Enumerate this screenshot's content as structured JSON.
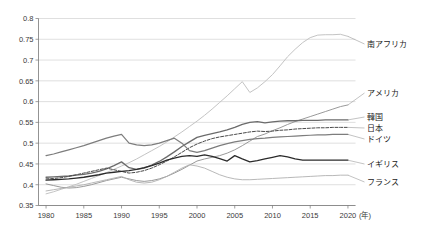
{
  "chart_data": {
    "type": "line",
    "title": "",
    "subtitle": "",
    "xlabel": "(年)",
    "ylabel": "",
    "xlim": [
      1979,
      2021
    ],
    "ylim": [
      0.35,
      0.8
    ],
    "grid": true,
    "legend_position": "right-inline-labels",
    "x_ticks": [
      1980,
      1985,
      1990,
      1995,
      2000,
      2005,
      2010,
      2015,
      2020
    ],
    "x_tick_labels": [
      "1980",
      "1985",
      "1990",
      "1995",
      "2000",
      "2005",
      "2010",
      "2015",
      "2020"
    ],
    "y_ticks": [
      0.35,
      0.4,
      0.45,
      0.5,
      0.55,
      0.6,
      0.65,
      0.7,
      0.75,
      0.8
    ],
    "y_tick_labels": [
      "0.35",
      "0.4",
      "0.45",
      "0.5",
      "0.55",
      "0.6",
      "0.65",
      "0.7",
      "0.75",
      "0.8"
    ],
    "x": [
      1980,
      1981,
      1982,
      1983,
      1984,
      1985,
      1986,
      1987,
      1988,
      1989,
      1990,
      1991,
      1992,
      1993,
      1994,
      1995,
      1996,
      1997,
      1998,
      1999,
      2000,
      2001,
      2002,
      2003,
      2004,
      2005,
      2006,
      2007,
      2008,
      2009,
      2010,
      2011,
      2012,
      2013,
      2014,
      2015,
      2016,
      2017,
      2018,
      2019,
      2020
    ],
    "series": [
      {
        "name": "南アフリカ",
        "label": "南アフリカ",
        "color": "#c4c4c4",
        "style": "solid",
        "width": 1.0,
        "label_value": 0.757,
        "values": [
          0.378,
          0.383,
          0.389,
          0.395,
          0.401,
          0.408,
          0.415,
          0.422,
          0.429,
          0.437,
          0.445,
          0.453,
          0.462,
          0.472,
          0.482,
          0.492,
          0.503,
          0.515,
          0.527,
          0.54,
          0.553,
          0.567,
          0.582,
          0.598,
          0.614,
          0.631,
          0.648,
          0.622,
          0.633,
          0.648,
          0.665,
          0.686,
          0.708,
          0.726,
          0.742,
          0.754,
          0.76,
          0.761,
          0.761,
          0.762,
          0.757
        ]
      },
      {
        "name": "アメリカ",
        "label": "アメリカ",
        "color": "#9a9a9a",
        "style": "solid",
        "width": 1.0,
        "label_value": 0.592,
        "values": [
          0.402,
          0.398,
          0.394,
          0.392,
          0.393,
          0.396,
          0.4,
          0.405,
          0.41,
          0.414,
          0.418,
          0.414,
          0.41,
          0.408,
          0.41,
          0.414,
          0.42,
          0.428,
          0.437,
          0.447,
          0.457,
          0.462,
          0.466,
          0.47,
          0.476,
          0.484,
          0.494,
          0.505,
          0.516,
          0.522,
          0.53,
          0.537,
          0.545,
          0.552,
          0.558,
          0.564,
          0.57,
          0.576,
          0.582,
          0.588,
          0.592
        ]
      },
      {
        "name": "韓国",
        "label": "韓国",
        "color": "#6b6b6b",
        "style": "solid",
        "width": 1.3,
        "label_value": 0.556,
        "values": [
          0.418,
          0.419,
          0.42,
          0.421,
          0.423,
          0.425,
          0.428,
          0.432,
          0.438,
          0.446,
          0.455,
          0.441,
          0.437,
          0.44,
          0.447,
          0.456,
          0.467,
          0.479,
          0.492,
          0.503,
          0.514,
          0.519,
          0.523,
          0.527,
          0.532,
          0.538,
          0.545,
          0.55,
          0.552,
          0.549,
          0.551,
          0.553,
          0.554,
          0.554,
          0.555,
          0.555,
          0.555,
          0.556,
          0.556,
          0.556,
          0.556
        ]
      },
      {
        "name": "日本",
        "label": "日本",
        "color": "#4a4a4a",
        "style": "dashed",
        "width": 1.0,
        "label_value": 0.538,
        "values": [
          0.414,
          0.415,
          0.417,
          0.42,
          0.424,
          0.428,
          0.432,
          0.436,
          0.44,
          0.436,
          0.432,
          0.428,
          0.43,
          0.434,
          0.44,
          0.448,
          0.457,
          0.467,
          0.478,
          0.489,
          0.498,
          0.505,
          0.511,
          0.515,
          0.518,
          0.521,
          0.524,
          0.527,
          0.529,
          0.528,
          0.529,
          0.531,
          0.532,
          0.534,
          0.535,
          0.536,
          0.537,
          0.537,
          0.538,
          0.538,
          0.538
        ]
      },
      {
        "name": "ドイツ",
        "label": "ドイツ",
        "color": "#7d7d7d",
        "style": "solid",
        "width": 1.2,
        "label_value": 0.521,
        "values": [
          0.47,
          0.474,
          0.479,
          0.484,
          0.489,
          0.494,
          0.5,
          0.506,
          0.512,
          0.517,
          0.521,
          0.5,
          0.496,
          0.494,
          0.496,
          0.5,
          0.506,
          0.512,
          0.5,
          0.482,
          0.478,
          0.482,
          0.488,
          0.494,
          0.499,
          0.503,
          0.506,
          0.509,
          0.511,
          0.512,
          0.514,
          0.515,
          0.516,
          0.517,
          0.518,
          0.519,
          0.52,
          0.52,
          0.521,
          0.521,
          0.521
        ]
      },
      {
        "name": "イギリス",
        "label": "イギリス",
        "color": "#2b2b2b",
        "style": "solid",
        "width": 1.3,
        "label_value": 0.459,
        "values": [
          0.411,
          0.412,
          0.413,
          0.414,
          0.416,
          0.418,
          0.421,
          0.424,
          0.428,
          0.43,
          0.432,
          0.434,
          0.437,
          0.441,
          0.446,
          0.452,
          0.459,
          0.464,
          0.468,
          0.47,
          0.468,
          0.472,
          0.468,
          0.463,
          0.457,
          0.47,
          0.462,
          0.455,
          0.458,
          0.462,
          0.466,
          0.47,
          0.467,
          0.462,
          0.459,
          0.459,
          0.459,
          0.459,
          0.459,
          0.459,
          0.459
        ]
      },
      {
        "name": "フランス",
        "label": "フランス",
        "color": "#b0b0b0",
        "style": "solid",
        "width": 0.9,
        "label_value": 0.423,
        "values": [
          0.385,
          0.388,
          0.391,
          0.394,
          0.397,
          0.4,
          0.404,
          0.408,
          0.412,
          0.416,
          0.42,
          0.412,
          0.406,
          0.404,
          0.406,
          0.412,
          0.42,
          0.43,
          0.44,
          0.448,
          0.445,
          0.44,
          0.432,
          0.424,
          0.418,
          0.414,
          0.412,
          0.412,
          0.413,
          0.414,
          0.415,
          0.416,
          0.417,
          0.418,
          0.419,
          0.42,
          0.421,
          0.422,
          0.422,
          0.423,
          0.423
        ]
      }
    ]
  },
  "axis": {
    "x_unit_label": "(年)"
  }
}
